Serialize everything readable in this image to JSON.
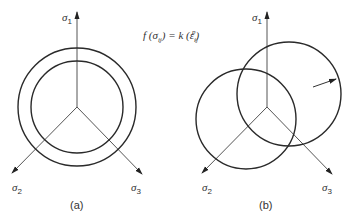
{
  "formula": {
    "f": "f",
    "lparen1": " (",
    "sigma": "σ",
    "sigma_sub": "ij",
    "rparen1": ")",
    "equals": " = ",
    "k": "k",
    "lparen2": " (",
    "epsilon": "ε",
    "epsilon_sub": "ij",
    "epsilon_sup": "p",
    "rparen2": ")"
  },
  "diagram_a": {
    "caption": "(a)",
    "axes": [
      {
        "symbol": "σ",
        "sub": "1"
      },
      {
        "symbol": "σ",
        "sub": "2"
      },
      {
        "symbol": "σ",
        "sub": "3"
      }
    ],
    "description": "Isotropic hardening: concentric yield surfaces"
  },
  "diagram_b": {
    "caption": "(b)",
    "axes": [
      {
        "symbol": "σ",
        "sub": "1"
      },
      {
        "symbol": "σ",
        "sub": "2"
      },
      {
        "symbol": "σ",
        "sub": "3"
      }
    ],
    "description": "Kinematic hardening: translated yield surface"
  },
  "colors": {
    "line": "#2a2a2a",
    "axis": "#555555",
    "background": "#ffffff"
  }
}
